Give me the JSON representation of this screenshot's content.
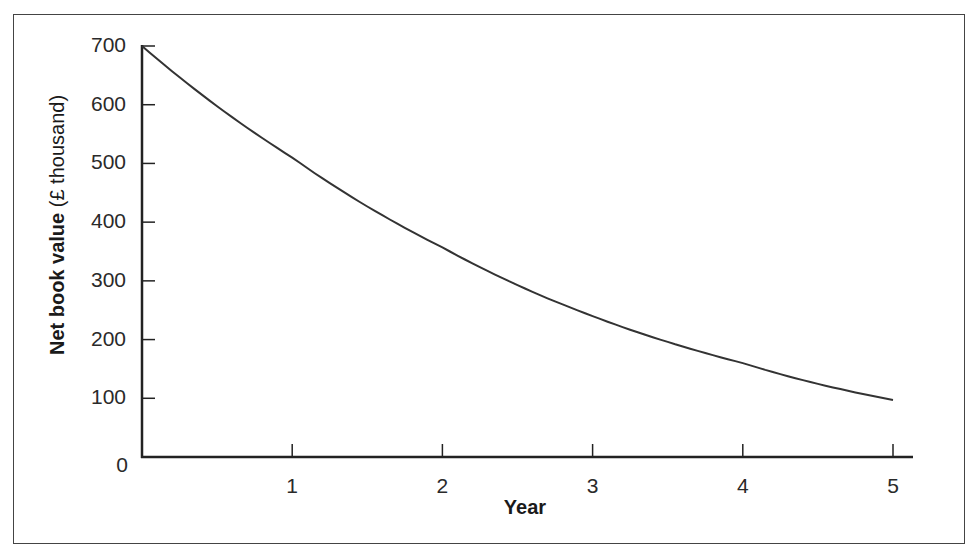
{
  "chart_data": {
    "type": "line",
    "title": "",
    "xlabel": "Year",
    "ylabel_bold": "Net book value",
    "ylabel_unit": "(£ thousand)",
    "ylabel": "Net book value (£ thousand)",
    "x": [
      0,
      1,
      2,
      3,
      4,
      5
    ],
    "x_ticks": [
      "1",
      "2",
      "3",
      "4",
      "5"
    ],
    "y_ticks": [
      "0",
      "100",
      "200",
      "300",
      "400",
      "500",
      "600",
      "700"
    ],
    "xlim": [
      0,
      5
    ],
    "ylim": [
      0,
      700
    ],
    "grid": false,
    "legend": null,
    "series": [
      {
        "name": "Net book value",
        "values": [
          700,
          510,
          357,
          240,
          160,
          97
        ]
      }
    ]
  },
  "colors": {
    "line": "#333333",
    "axis": "#222222",
    "frame": "#444444"
  }
}
